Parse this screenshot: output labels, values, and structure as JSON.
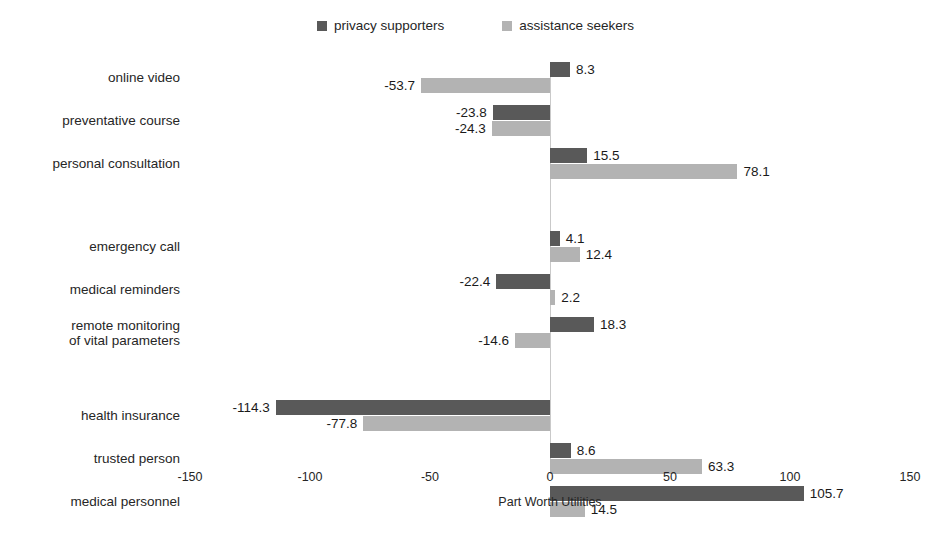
{
  "chart_data": {
    "type": "bar",
    "orientation": "horizontal",
    "title": "",
    "xlabel": "Part Worth Utilities",
    "ylabel": "",
    "xlim": [
      -150,
      150
    ],
    "xticks": [
      -150,
      -100,
      -50,
      0,
      50,
      100,
      150
    ],
    "xtick_labels": [
      "-150",
      "-100",
      "-50",
      "0",
      "50",
      "100",
      "150"
    ],
    "grid": false,
    "legend_position": "top-center",
    "categories": [
      "online video",
      "preventative course",
      "personal consultation",
      "emergency call",
      "medical reminders",
      "remote monitoring\nof vital parameters",
      "health insurance",
      "trusted person",
      "medical personnel"
    ],
    "groups": [
      {
        "categories": [
          "online video",
          "preventative course",
          "personal consultation"
        ]
      },
      {
        "categories": [
          "emergency call",
          "medical reminders",
          "remote monitoring\nof vital parameters"
        ]
      },
      {
        "categories": [
          "health insurance",
          "trusted person",
          "medical personnel"
        ]
      }
    ],
    "series": [
      {
        "name": "privacy supporters",
        "color": "#595959",
        "values": [
          8.3,
          -23.8,
          15.5,
          4.1,
          -22.4,
          18.3,
          -114.3,
          8.6,
          105.7
        ],
        "value_labels": [
          "8.3",
          "-23.8",
          "15.5",
          "4.1",
          "-22.4",
          "18.3",
          "-114.3",
          "8.6",
          "105.7"
        ]
      },
      {
        "name": "assistance seekers",
        "color": "#b3b3b3",
        "values": [
          -53.7,
          -24.3,
          78.1,
          12.4,
          2.2,
          -14.6,
          -77.8,
          63.3,
          14.5
        ],
        "value_labels": [
          "-53.7",
          "-24.3",
          "78.1",
          "12.4",
          "2.2",
          "-14.6",
          "-77.8",
          "63.3",
          "14.5"
        ]
      }
    ]
  },
  "legend": {
    "entries": [
      {
        "label": "privacy supporters",
        "color": "#595959"
      },
      {
        "label": "assistance seekers",
        "color": "#b3b3b3"
      }
    ]
  },
  "axis": {
    "title": "Part Worth Utilities"
  }
}
